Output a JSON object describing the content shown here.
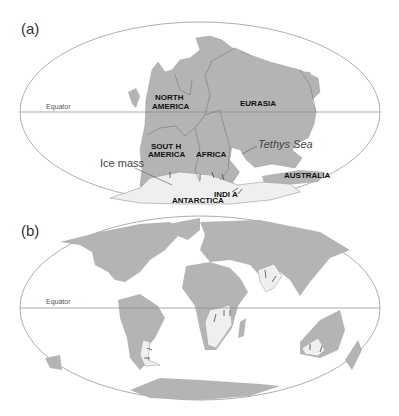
{
  "figure": {
    "panels": [
      {
        "label": "(a)",
        "equator_label": "Equator",
        "continents": [
          "NORTH",
          "AMERICA",
          "SOUT H",
          "AMERICA",
          "AFRICA",
          "EURASIA",
          "ANTARCTICA",
          "INDI A",
          "AUSTRALIA"
        ],
        "annotations": {
          "ice_mass": "Ice mass",
          "tethys": "Tethys Sea"
        }
      },
      {
        "label": "(b)",
        "equator_label": "Equator"
      }
    ],
    "colors": {
      "land": "#b4b4b4",
      "ice": "#efefef",
      "outline": "#8a8a8a",
      "background": "#ffffff"
    }
  }
}
